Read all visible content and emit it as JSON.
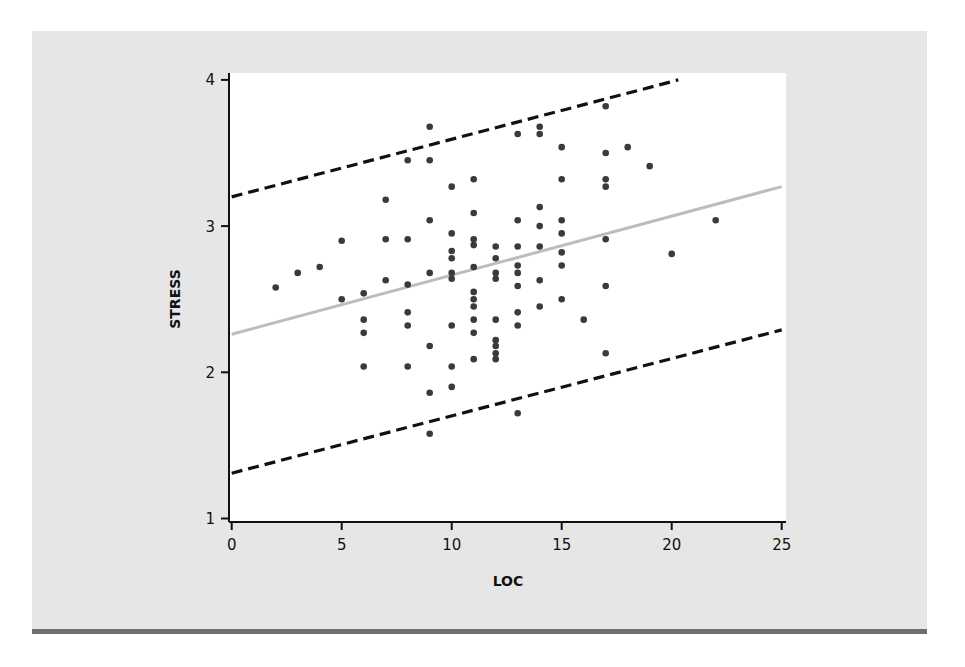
{
  "chart_data": {
    "type": "scatter",
    "title": "",
    "xlabel": "LOC",
    "ylabel": "STRESS",
    "xlim": [
      0,
      25
    ],
    "ylim": [
      1,
      4
    ],
    "xticks": [
      0,
      5,
      10,
      15,
      20,
      25
    ],
    "yticks": [
      1,
      2,
      3,
      4
    ],
    "grid": false,
    "legend": null,
    "colors": {
      "points": "#3a3a3a",
      "regression": "#bdbdbd",
      "bands": "#111111",
      "panel": "#e6e6e6",
      "plot_bg": "#ffffff",
      "border": "#6f6f6f"
    },
    "series": [
      {
        "name": "observations",
        "type": "scatter",
        "points": [
          [
            2,
            2.58
          ],
          [
            3,
            2.68
          ],
          [
            4,
            2.72
          ],
          [
            5,
            2.9
          ],
          [
            5,
            2.5
          ],
          [
            6,
            2.54
          ],
          [
            6,
            2.36
          ],
          [
            6,
            2.27
          ],
          [
            6,
            2.04
          ],
          [
            7,
            3.18
          ],
          [
            7,
            2.91
          ],
          [
            7,
            2.63
          ],
          [
            8,
            3.45
          ],
          [
            8,
            2.91
          ],
          [
            8,
            2.6
          ],
          [
            8,
            2.41
          ],
          [
            8,
            2.32
          ],
          [
            8,
            2.04
          ],
          [
            9,
            3.68
          ],
          [
            9,
            3.45
          ],
          [
            9,
            3.04
          ],
          [
            9,
            2.68
          ],
          [
            9,
            2.18
          ],
          [
            9,
            1.86
          ],
          [
            9,
            1.58
          ],
          [
            10,
            3.27
          ],
          [
            10,
            2.95
          ],
          [
            10,
            2.83
          ],
          [
            10,
            2.78
          ],
          [
            10,
            2.68
          ],
          [
            10,
            2.64
          ],
          [
            10,
            2.32
          ],
          [
            10,
            2.04
          ],
          [
            10,
            1.9
          ],
          [
            11,
            3.32
          ],
          [
            11,
            3.09
          ],
          [
            11,
            2.91
          ],
          [
            11,
            2.87
          ],
          [
            11,
            2.72
          ],
          [
            11,
            2.55
          ],
          [
            11,
            2.5
          ],
          [
            11,
            2.45
          ],
          [
            11,
            2.36
          ],
          [
            11,
            2.27
          ],
          [
            11,
            2.09
          ],
          [
            12,
            2.86
          ],
          [
            12,
            2.78
          ],
          [
            12,
            2.68
          ],
          [
            12,
            2.64
          ],
          [
            12,
            2.36
          ],
          [
            12,
            2.22
          ],
          [
            12,
            2.18
          ],
          [
            12,
            2.13
          ],
          [
            12,
            2.09
          ],
          [
            13,
            3.63
          ],
          [
            13,
            3.04
          ],
          [
            13,
            2.86
          ],
          [
            13,
            2.73
          ],
          [
            13,
            2.68
          ],
          [
            13,
            2.59
          ],
          [
            13,
            2.41
          ],
          [
            13,
            2.32
          ],
          [
            13,
            1.72
          ],
          [
            14,
            3.68
          ],
          [
            14,
            3.63
          ],
          [
            14,
            3.13
          ],
          [
            14,
            3.0
          ],
          [
            14,
            2.86
          ],
          [
            14,
            2.63
          ],
          [
            14,
            2.45
          ],
          [
            15,
            3.54
          ],
          [
            15,
            3.32
          ],
          [
            15,
            3.04
          ],
          [
            15,
            2.95
          ],
          [
            15,
            2.82
          ],
          [
            15,
            2.73
          ],
          [
            15,
            2.5
          ],
          [
            16,
            2.36
          ],
          [
            17,
            3.82
          ],
          [
            17,
            3.5
          ],
          [
            17,
            3.32
          ],
          [
            17,
            3.27
          ],
          [
            17,
            2.91
          ],
          [
            17,
            2.59
          ],
          [
            17,
            2.13
          ],
          [
            18,
            3.54
          ],
          [
            19,
            3.41
          ],
          [
            20,
            2.81
          ],
          [
            22,
            3.04
          ]
        ]
      },
      {
        "name": "regression line",
        "type": "line",
        "style": "solid",
        "points": [
          [
            0,
            2.26
          ],
          [
            25,
            3.27
          ]
        ]
      },
      {
        "name": "upper prediction bound",
        "type": "line",
        "style": "dashed",
        "points": [
          [
            0,
            3.2
          ],
          [
            20.3,
            4.0
          ]
        ]
      },
      {
        "name": "lower prediction bound",
        "type": "line",
        "style": "dashed",
        "points": [
          [
            0,
            1.31
          ],
          [
            25,
            2.29
          ]
        ]
      }
    ]
  }
}
